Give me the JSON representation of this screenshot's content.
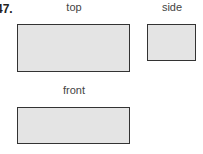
{
  "problem": {
    "number": "47."
  },
  "views": {
    "top": {
      "label": "top"
    },
    "side": {
      "label": "side"
    },
    "front": {
      "label": "front"
    }
  },
  "colors": {
    "fill": "#e4e4e4",
    "stroke": "#333333"
  }
}
